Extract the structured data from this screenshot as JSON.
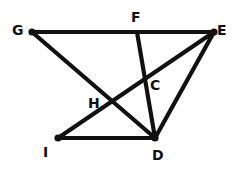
{
  "figure": {
    "type": "geometry-diagram",
    "stroke_color": "#111111",
    "background": "#ffffff",
    "points": [
      {
        "id": "G",
        "label": "G",
        "x": 32,
        "y": 32,
        "lx": 12,
        "ly": 35
      },
      {
        "id": "F",
        "label": "F",
        "x": 137,
        "y": 32,
        "lx": 131,
        "ly": 22
      },
      {
        "id": "E",
        "label": "E",
        "x": 214,
        "y": 32,
        "lx": 217,
        "ly": 35
      },
      {
        "id": "C",
        "label": "C",
        "x": 145,
        "y": 80,
        "lx": 150,
        "ly": 90
      },
      {
        "id": "H",
        "label": "H",
        "x": 113,
        "y": 100,
        "lx": 88,
        "ly": 108
      },
      {
        "id": "I",
        "label": "I",
        "x": 58,
        "y": 138,
        "lx": 43,
        "ly": 157
      },
      {
        "id": "D",
        "label": "D",
        "x": 155,
        "y": 138,
        "lx": 152,
        "ly": 160
      }
    ],
    "segments": [
      {
        "from": "G",
        "to": "E"
      },
      {
        "from": "G",
        "to": "D"
      },
      {
        "from": "F",
        "to": "D"
      },
      {
        "from": "E",
        "to": "D"
      },
      {
        "from": "E",
        "to": "I"
      },
      {
        "from": "I",
        "to": "D"
      }
    ],
    "vertex_dots": [
      "G",
      "E",
      "I",
      "D"
    ]
  }
}
